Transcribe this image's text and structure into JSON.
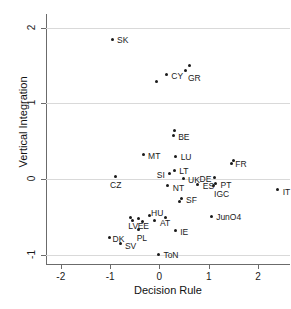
{
  "chart_data": {
    "type": "scatter",
    "title": "",
    "xlabel": "Decision Rule",
    "ylabel": "Vertical Integration",
    "xlim": [
      -2.3,
      2.65
    ],
    "ylim": [
      -1.12,
      2.18
    ],
    "xticks": [
      -2,
      -1,
      0,
      1,
      2
    ],
    "yticks": [
      -1,
      0,
      1,
      2
    ],
    "xtick_labels": [
      "-2",
      "-1",
      "0",
      "1",
      "2"
    ],
    "ytick_labels": [
      "-1",
      "0",
      "1",
      "2"
    ],
    "grid": "horizontal",
    "legend": "none",
    "points": [
      {
        "label": "SK",
        "x": -0.96,
        "y": 1.84,
        "lx": 5,
        "ly": -4
      },
      {
        "label": "CY",
        "x": 0.14,
        "y": 1.38,
        "lx": 5,
        "ly": -3
      },
      {
        "label": "",
        "x": -0.06,
        "y": 1.29,
        "lx": 0,
        "ly": 0
      },
      {
        "label": "GR",
        "x": 0.54,
        "y": 1.44,
        "lx": 2,
        "ly": 4
      },
      {
        "label": "",
        "x": 0.62,
        "y": 1.5,
        "lx": 0,
        "ly": 0
      },
      {
        "label": "BE",
        "x": 0.28,
        "y": 0.57,
        "lx": 5,
        "ly": -3
      },
      {
        "label": "",
        "x": 0.31,
        "y": 0.64,
        "lx": 0,
        "ly": 0
      },
      {
        "label": "MT",
        "x": -0.33,
        "y": 0.32,
        "lx": 5,
        "ly": -3
      },
      {
        "label": "LU",
        "x": 0.33,
        "y": 0.3,
        "lx": 5,
        "ly": -3
      },
      {
        "label": "FR",
        "x": 1.46,
        "y": 0.21,
        "lx": 4,
        "ly": -3
      },
      {
        "label": "",
        "x": 1.5,
        "y": 0.24,
        "lx": 0,
        "ly": 0
      },
      {
        "label": "SI",
        "x": 0.21,
        "y": 0.07,
        "lx": -13,
        "ly": -3
      },
      {
        "label": "LT",
        "x": 0.3,
        "y": 0.11,
        "lx": 5,
        "ly": -4
      },
      {
        "label": "CZ",
        "x": -0.9,
        "y": 0.03,
        "lx": -5,
        "ly": 4
      },
      {
        "label": "UK",
        "x": 0.48,
        "y": 0.01,
        "lx": 5,
        "ly": -2
      },
      {
        "label": "DE",
        "x": 1.12,
        "y": 0.02,
        "lx": -15,
        "ly": -3
      },
      {
        "label": "NT",
        "x": 0.17,
        "y": -0.09,
        "lx": 5,
        "ly": -2
      },
      {
        "label": "ES",
        "x": 0.78,
        "y": -0.07,
        "lx": 5,
        "ly": -2
      },
      {
        "label": "PT",
        "x": 1.14,
        "y": -0.06,
        "lx": 5,
        "ly": -3
      },
      {
        "label": "IGC",
        "x": 1.09,
        "y": -0.09,
        "lx": 1,
        "ly": 4
      },
      {
        "label": "IT",
        "x": 2.4,
        "y": -0.14,
        "lx": 5,
        "ly": -2
      },
      {
        "label": "SF",
        "x": 0.44,
        "y": -0.25,
        "lx": 5,
        "ly": -2
      },
      {
        "label": "",
        "x": 0.41,
        "y": -0.3,
        "lx": 0,
        "ly": 0
      },
      {
        "label": "HU",
        "x": -0.21,
        "y": -0.48,
        "lx": 2,
        "ly": -7
      },
      {
        "label": "EE",
        "x": -0.42,
        "y": -0.52,
        "lx": -1,
        "ly": 3
      },
      {
        "label": "",
        "x": -0.34,
        "y": -0.56,
        "lx": 0,
        "ly": 0
      },
      {
        "label": "LV",
        "x": -0.59,
        "y": -0.5,
        "lx": -2,
        "ly": 5
      },
      {
        "label": "",
        "x": -0.55,
        "y": -0.55,
        "lx": 0,
        "ly": 0
      },
      {
        "label": "AT",
        "x": -0.09,
        "y": -0.55,
        "lx": 5,
        "ly": -2
      },
      {
        "label": "",
        "x": 0.12,
        "y": -0.5,
        "lx": 0,
        "ly": 0
      },
      {
        "label": "JunO4",
        "x": 1.05,
        "y": -0.49,
        "lx": 5,
        "ly": -3
      },
      {
        "label": "IE",
        "x": 0.32,
        "y": -0.68,
        "lx": 5,
        "ly": -3
      },
      {
        "label": "PL",
        "x": -0.42,
        "y": -0.66,
        "lx": -2,
        "ly": 5
      },
      {
        "label": "DK",
        "x": -1.01,
        "y": -0.77,
        "lx": 3,
        "ly": -2
      },
      {
        "label": "SV",
        "x": -0.78,
        "y": -0.85,
        "lx": 4,
        "ly": -2
      },
      {
        "label": "ToN",
        "x": -0.02,
        "y": -0.99,
        "lx": 5,
        "ly": -3
      }
    ]
  }
}
